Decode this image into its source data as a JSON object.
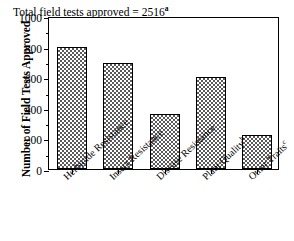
{
  "chart_data": {
    "type": "bar",
    "title": "",
    "xlabel": "",
    "ylabel": "Number of Field Tests Approved",
    "ylim": [
      0,
      1000
    ],
    "ytick_labels": [
      "0",
      "200",
      "400",
      "600",
      "800",
      "1000"
    ],
    "ytick_values": [
      0,
      200,
      400,
      600,
      800,
      1000
    ],
    "yminor_values": [
      100,
      300,
      500,
      700,
      900
    ],
    "grid": false,
    "legend": false,
    "annotation": {
      "text": "Total field tests approved = 2516",
      "superscript": "a"
    },
    "categories": [
      "Herbicide Resistance",
      "Insect Resistance",
      "Disease Resistance",
      "Plant Quality",
      "Other Traits"
    ],
    "category_superscripts": [
      "",
      "",
      "",
      "b",
      "c"
    ],
    "values": [
      800,
      690,
      360,
      600,
      225
    ],
    "bar_fill": "checkerboard-hatch",
    "bar_color": "#59595b",
    "bar_edge_color": "#000000",
    "axis_color": "#000000",
    "background_color": "#ffffff"
  }
}
